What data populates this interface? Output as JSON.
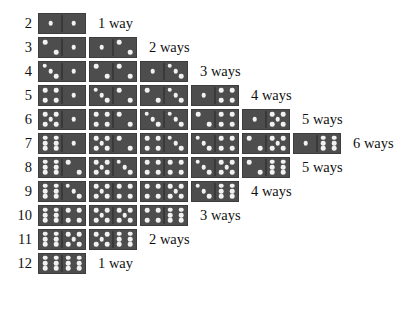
{
  "chart_data": {
    "type": "table",
    "xlabel": "",
    "ylabel": "Sum",
    "categories": [
      "2",
      "3",
      "4",
      "5",
      "6",
      "7",
      "8",
      "9",
      "10",
      "11",
      "12"
    ],
    "values": [
      1,
      2,
      3,
      4,
      5,
      6,
      5,
      4,
      3,
      2,
      1
    ],
    "rows": [
      {
        "sum": "2",
        "count_label": "1 way",
        "count": 1,
        "combinations": [
          [
            1,
            1
          ]
        ]
      },
      {
        "sum": "3",
        "count_label": "2 ways",
        "count": 2,
        "combinations": [
          [
            2,
            1
          ],
          [
            1,
            2
          ]
        ]
      },
      {
        "sum": "4",
        "count_label": "3 ways",
        "count": 3,
        "combinations": [
          [
            3,
            1
          ],
          [
            2,
            2
          ],
          [
            1,
            3
          ]
        ]
      },
      {
        "sum": "5",
        "count_label": "4 ways",
        "count": 4,
        "combinations": [
          [
            4,
            1
          ],
          [
            3,
            2
          ],
          [
            2,
            3
          ],
          [
            1,
            4
          ]
        ]
      },
      {
        "sum": "6",
        "count_label": "5 ways",
        "count": 5,
        "combinations": [
          [
            5,
            1
          ],
          [
            4,
            2
          ],
          [
            3,
            3
          ],
          [
            2,
            4
          ],
          [
            1,
            5
          ]
        ]
      },
      {
        "sum": "7",
        "count_label": "6 ways",
        "count": 6,
        "combinations": [
          [
            6,
            1
          ],
          [
            5,
            2
          ],
          [
            4,
            3
          ],
          [
            3,
            4
          ],
          [
            2,
            5
          ],
          [
            1,
            6
          ]
        ]
      },
      {
        "sum": "8",
        "count_label": "5 ways",
        "count": 5,
        "combinations": [
          [
            6,
            2
          ],
          [
            5,
            3
          ],
          [
            4,
            4
          ],
          [
            3,
            5
          ],
          [
            2,
            6
          ]
        ]
      },
      {
        "sum": "9",
        "count_label": "4 ways",
        "count": 4,
        "combinations": [
          [
            6,
            3
          ],
          [
            5,
            4
          ],
          [
            4,
            5
          ],
          [
            3,
            6
          ]
        ]
      },
      {
        "sum": "10",
        "count_label": "3 ways",
        "count": 3,
        "combinations": [
          [
            6,
            4
          ],
          [
            5,
            5
          ],
          [
            4,
            6
          ]
        ]
      },
      {
        "sum": "11",
        "count_label": "2 ways",
        "count": 2,
        "combinations": [
          [
            6,
            5
          ],
          [
            5,
            6
          ]
        ]
      },
      {
        "sum": "12",
        "count_label": "1 way",
        "count": 1,
        "combinations": [
          [
            6,
            6
          ]
        ]
      }
    ],
    "colors": {
      "domino_face": "#4d4d4d",
      "pip": "#f2f2f2",
      "text": "#111111",
      "background": "#ffffff"
    },
    "layout": {
      "row_height": 24,
      "first_row_top": 12,
      "domino_width": 48,
      "domino_height": 21
    }
  }
}
